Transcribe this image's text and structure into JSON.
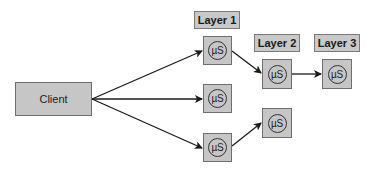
{
  "diagram": {
    "client": {
      "label": "Client"
    },
    "layers": [
      {
        "label": "Layer 1",
        "services": [
          "µS",
          "µS",
          "µS"
        ]
      },
      {
        "label": "Layer 2",
        "services": [
          "µS",
          "µS"
        ]
      },
      {
        "label": "Layer 3",
        "services": [
          "µS"
        ]
      }
    ],
    "connections": [
      {
        "from": "Client",
        "to": "Layer 1 / µS 1"
      },
      {
        "from": "Client",
        "to": "Layer 1 / µS 2"
      },
      {
        "from": "Client",
        "to": "Layer 1 / µS 3"
      },
      {
        "from": "Layer 1 / µS 1",
        "to": "Layer 2 / µS 1"
      },
      {
        "from": "Layer 1 / µS 3",
        "to": "Layer 2 / µS 2"
      },
      {
        "from": "Layer 2 / µS 1",
        "to": "Layer 3 / µS 1"
      }
    ],
    "colors": {
      "box_fill": "#c6c6c6",
      "box_border": "#6e6e6e",
      "line": "#1a1a1a",
      "background": "#ffffff"
    }
  }
}
